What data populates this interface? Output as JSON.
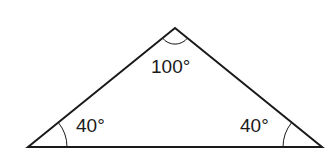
{
  "diagram": {
    "type": "triangle",
    "vertices": {
      "apex": {
        "x": 175,
        "y": 28
      },
      "left": {
        "x": 28,
        "y": 147
      },
      "right": {
        "x": 322,
        "y": 147
      }
    },
    "angles": {
      "apex": {
        "label": "100°",
        "value": 100
      },
      "left": {
        "label": "40°",
        "value": 40
      },
      "right": {
        "label": "40°",
        "value": 40
      }
    },
    "stroke_color": "#1a1a1a",
    "background_color": "#ffffff"
  }
}
